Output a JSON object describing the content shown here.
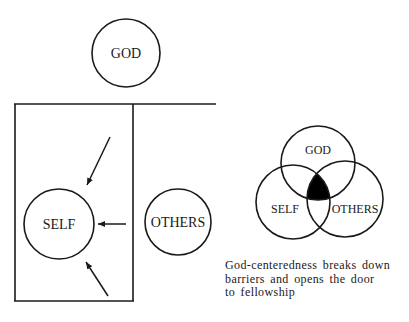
{
  "left_diagram": {
    "god_label": "GOD",
    "self_label": "SELF",
    "others_label": "OTHERS"
  },
  "venn_diagram": {
    "god_label": "GOD",
    "self_label": "SELF",
    "others_label": "OTHERS",
    "highlight_color": "#000000"
  },
  "caption": {
    "line1": "God-centeredness breaks down",
    "line2": "barriers and opens the door",
    "line3": "to fellowship"
  }
}
